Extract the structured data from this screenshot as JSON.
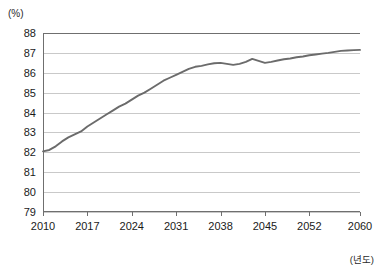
{
  "axes": {
    "y_unit_label": "(%)",
    "x_unit_label": "(년도)",
    "y_ticks": [
      88,
      87,
      86,
      85,
      84,
      83,
      82,
      81,
      80,
      79
    ],
    "x_ticks": [
      2010,
      2017,
      2024,
      2031,
      2038,
      2045,
      2052,
      2060
    ]
  },
  "style": {
    "line_color": "#6b6b6b",
    "gridline_color": "#c9c9c9",
    "axis_color": "#6f6f6f",
    "background": "#ffffff"
  },
  "chart_data": {
    "type": "line",
    "title": "",
    "subtitle": "",
    "xlabel": "(년도)",
    "ylabel": "(%)",
    "xlim": [
      2010,
      2060
    ],
    "ylim": [
      79,
      88
    ],
    "grid": true,
    "legend": false,
    "x_tick_labels": [
      "2010",
      "2017",
      "2024",
      "2031",
      "2038",
      "2045",
      "2052",
      "2060"
    ],
    "y_tick_labels": [
      "79",
      "80",
      "81",
      "82",
      "83",
      "84",
      "85",
      "86",
      "87",
      "88"
    ],
    "x": [
      2010,
      2011,
      2012,
      2013,
      2014,
      2015,
      2016,
      2017,
      2018,
      2019,
      2020,
      2021,
      2022,
      2023,
      2024,
      2025,
      2026,
      2027,
      2028,
      2029,
      2030,
      2031,
      2032,
      2033,
      2034,
      2035,
      2036,
      2037,
      2038,
      2039,
      2040,
      2041,
      2042,
      2043,
      2044,
      2045,
      2046,
      2047,
      2048,
      2049,
      2050,
      2051,
      2052,
      2053,
      2054,
      2055,
      2056,
      2057,
      2058,
      2059,
      2060
    ],
    "series": [
      {
        "name": "생산가능인구 비율",
        "values": [
          82.05,
          82.12,
          82.3,
          82.55,
          82.75,
          82.9,
          83.05,
          83.3,
          83.5,
          83.7,
          83.9,
          84.1,
          84.3,
          84.45,
          84.65,
          84.85,
          85.0,
          85.2,
          85.4,
          85.6,
          85.75,
          85.9,
          86.05,
          86.2,
          86.3,
          86.35,
          86.42,
          86.48,
          86.5,
          86.45,
          86.4,
          86.45,
          86.55,
          86.7,
          86.6,
          86.5,
          86.55,
          86.62,
          86.68,
          86.72,
          86.78,
          86.82,
          86.88,
          86.92,
          86.96,
          87.0,
          87.05,
          87.1,
          87.12,
          87.14,
          87.15
        ]
      }
    ]
  }
}
